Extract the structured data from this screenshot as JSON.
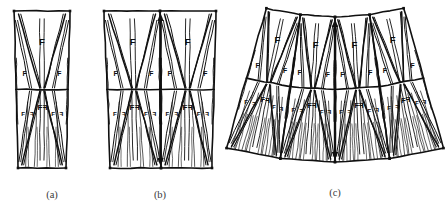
{
  "figure": {
    "background_color": "#ffffff",
    "ink_color": "#101010",
    "caption_color": "#3a3a3a",
    "panels": [
      {
        "id": "a",
        "caption": "(a)",
        "unit_count": 1,
        "description": "single wedge unit with mirrored lower half",
        "has_center_arrow": false
      },
      {
        "id": "b",
        "caption": "(b)",
        "unit_count": 2,
        "description": "two wedge units side by side with central double arrow",
        "has_center_arrow": true
      },
      {
        "id": "c",
        "caption": "(c)",
        "unit_count": 4,
        "description": "four wedge units fanned into an arc with central double arrow",
        "has_center_arrow": true
      }
    ],
    "letter": "F",
    "letters": {
      "large": "F",
      "medium": "F",
      "small": "F",
      "mirrored": "F"
    },
    "marker": "square-dot",
    "marker_color": "#101010"
  }
}
